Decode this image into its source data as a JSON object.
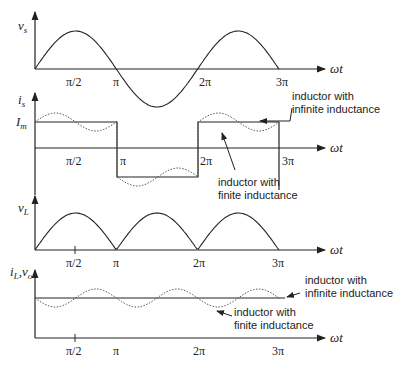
{
  "figure": {
    "panels": [
      {
        "ylabel": "v_s",
        "ylabel_main": "v",
        "ylabel_sub": "s",
        "xlabel": "ωt",
        "ticks": [
          "π/2",
          "π",
          "2π",
          "3π"
        ]
      },
      {
        "ylabel": "i_s",
        "ylabel_main": "i",
        "ylabel_sub": "s",
        "level_label_main": "I",
        "level_label_sub": "m",
        "xlabel": "ωt",
        "ticks": [
          "π/2",
          "π",
          "2π",
          "3π"
        ],
        "annotations": [
          {
            "line1": "inductor with",
            "line2": "infinite inductance"
          },
          {
            "line1": "inductor with",
            "line2": "finite inductance"
          }
        ]
      },
      {
        "ylabel": "v_L",
        "ylabel_main": "v",
        "ylabel_sub": "L",
        "xlabel": "ωt",
        "ticks": [
          "π/2",
          "π",
          "2π",
          "3π"
        ]
      },
      {
        "ylabel": "i_L, v_o",
        "ylabel_main1": "i",
        "ylabel_sub1": "L",
        "ylabel_main2": "v",
        "ylabel_sub2": "o",
        "xlabel": "ωt",
        "ticks": [
          "π/2",
          "π",
          "2π",
          "3π"
        ],
        "annotations": [
          {
            "line1": "inductor with",
            "line2": "infinite inductance"
          },
          {
            "line1": "inductor with",
            "line2": "finite inductance"
          }
        ]
      }
    ]
  }
}
